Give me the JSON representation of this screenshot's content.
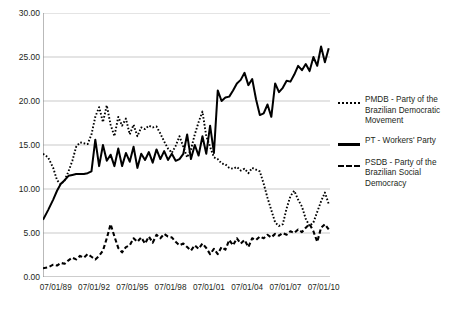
{
  "chart_data": {
    "type": "line",
    "title": "",
    "xlabel": "",
    "ylabel": "",
    "ylim": [
      0,
      30
    ],
    "yticks": [
      "0.00",
      "5.00",
      "10.00",
      "15.00",
      "20.00",
      "25.00",
      "30.00"
    ],
    "grid": true,
    "legend_position": "right",
    "xtick_labels": [
      "07/01/89",
      "07/01/92",
      "07/01/95",
      "07/01/98",
      "07/01/01",
      "07/01/04",
      "07/01/07",
      "07/01/10"
    ],
    "xlim_years": [
      1988.5,
      2011.0
    ],
    "series": [
      {
        "name": "PMDB - Party of the Brazilian Democratic Movement",
        "short": "PMDB",
        "style": "dotted",
        "color": "#000000",
        "x": [
          1988.5,
          1988.9,
          1989.3,
          1989.6,
          1989.9,
          1990.2,
          1990.5,
          1990.8,
          1991.1,
          1991.4,
          1991.7,
          1992.0,
          1992.3,
          1992.6,
          1992.9,
          1993.2,
          1993.5,
          1993.8,
          1994.1,
          1994.4,
          1994.7,
          1995.0,
          1995.3,
          1995.6,
          1995.9,
          1996.2,
          1996.5,
          1996.8,
          1997.1,
          1997.4,
          1997.7,
          1998.0,
          1998.3,
          1998.6,
          1998.9,
          1999.2,
          1999.5,
          1999.8,
          2000.1,
          2000.4,
          2000.7,
          2001.0,
          2001.3,
          2001.6,
          2001.9,
          2002.2,
          2002.5,
          2002.8,
          2003.1,
          2003.4,
          2003.7,
          2004.0,
          2004.3,
          2004.6,
          2004.9,
          2005.2,
          2005.5,
          2005.8,
          2006.1,
          2006.4,
          2006.7,
          2007.0,
          2007.3,
          2007.6,
          2007.9,
          2008.2,
          2008.5,
          2008.8,
          2009.1,
          2009.4,
          2009.7,
          2010.0,
          2010.3,
          2010.6,
          2010.9
        ],
        "values": [
          14.0,
          13.6,
          12.4,
          11.0,
          10.5,
          11.0,
          12.0,
          13.2,
          14.8,
          15.3,
          15.2,
          15.1,
          16.2,
          18.2,
          19.3,
          17.6,
          19.5,
          17.3,
          16.0,
          18.2,
          17.2,
          18.0,
          16.2,
          17.3,
          16.0,
          17.0,
          16.8,
          17.2,
          17.0,
          17.1,
          16.3,
          15.4,
          14.6,
          14.1,
          14.9,
          16.0,
          14.8,
          13.6,
          14.5,
          16.2,
          17.6,
          18.8,
          16.0,
          14.8,
          13.6,
          13.4,
          12.9,
          12.8,
          12.4,
          12.3,
          12.5,
          12.1,
          12.3,
          11.8,
          12.4,
          12.2,
          12.0,
          10.6,
          9.0,
          7.6,
          6.2,
          5.8,
          6.0,
          7.8,
          9.2,
          9.8,
          8.8,
          8.0,
          6.6,
          5.8,
          6.2,
          7.4,
          8.6,
          9.6,
          8.3
        ]
      },
      {
        "name": "PT - Workers' Party",
        "short": "PT",
        "style": "solid",
        "color": "#000000",
        "x": [
          1988.5,
          1988.9,
          1989.3,
          1989.6,
          1989.9,
          1990.2,
          1990.5,
          1990.8,
          1991.1,
          1991.4,
          1991.7,
          1992.0,
          1992.3,
          1992.6,
          1992.9,
          1993.2,
          1993.5,
          1993.8,
          1994.1,
          1994.4,
          1994.7,
          1995.0,
          1995.3,
          1995.6,
          1995.9,
          1996.2,
          1996.5,
          1996.8,
          1997.1,
          1997.4,
          1997.7,
          1998.0,
          1998.3,
          1998.6,
          1998.9,
          1999.2,
          1999.5,
          1999.8,
          2000.1,
          2000.4,
          2000.7,
          2001.0,
          2001.3,
          2001.6,
          2001.9,
          2002.2,
          2002.5,
          2002.8,
          2003.1,
          2003.4,
          2003.7,
          2004.0,
          2004.3,
          2004.6,
          2004.9,
          2005.2,
          2005.5,
          2005.8,
          2006.1,
          2006.4,
          2006.7,
          2007.0,
          2007.3,
          2007.6,
          2007.9,
          2008.2,
          2008.5,
          2008.8,
          2009.1,
          2009.4,
          2009.7,
          2010.0,
          2010.3,
          2010.6,
          2010.9
        ],
        "values": [
          6.5,
          7.6,
          8.8,
          9.8,
          10.6,
          11.0,
          11.5,
          11.6,
          11.7,
          11.7,
          11.7,
          11.8,
          12.0,
          15.6,
          12.6,
          15.0,
          13.2,
          13.9,
          12.6,
          14.6,
          12.6,
          14.1,
          13.1,
          14.8,
          12.4,
          14.0,
          13.3,
          14.2,
          13.0,
          14.5,
          13.4,
          14.3,
          13.3,
          14.0,
          13.2,
          13.4,
          14.0,
          16.2,
          13.4,
          15.0,
          13.8,
          16.0,
          14.0,
          17.2,
          14.1,
          21.2,
          20.0,
          20.4,
          20.5,
          21.2,
          22.0,
          22.4,
          23.2,
          21.8,
          22.5,
          20.2,
          18.4,
          18.6,
          19.6,
          18.2,
          22.0,
          21.0,
          21.5,
          22.3,
          22.2,
          23.0,
          24.0,
          23.5,
          24.2,
          23.4,
          25.0,
          24.0,
          26.2,
          24.4,
          26.0
        ]
      },
      {
        "name": "PSDB - Party of the Brazilian Social Democracy",
        "short": "PSDB",
        "style": "dashed",
        "color": "#000000",
        "x": [
          1988.5,
          1988.9,
          1989.3,
          1989.6,
          1989.9,
          1990.2,
          1990.5,
          1990.8,
          1991.1,
          1991.4,
          1991.7,
          1992.0,
          1992.3,
          1992.6,
          1992.9,
          1993.2,
          1993.5,
          1993.8,
          1994.1,
          1994.4,
          1994.7,
          1995.0,
          1995.3,
          1995.6,
          1995.9,
          1996.2,
          1996.5,
          1996.8,
          1997.1,
          1997.4,
          1997.7,
          1998.0,
          1998.3,
          1998.6,
          1998.9,
          1999.2,
          1999.5,
          1999.8,
          2000.1,
          2000.4,
          2000.7,
          2001.0,
          2001.3,
          2001.6,
          2001.9,
          2002.2,
          2002.5,
          2002.8,
          2003.1,
          2003.4,
          2003.7,
          2004.0,
          2004.3,
          2004.6,
          2004.9,
          2005.2,
          2005.5,
          2005.8,
          2006.1,
          2006.4,
          2006.7,
          2007.0,
          2007.3,
          2007.6,
          2007.9,
          2008.2,
          2008.5,
          2008.8,
          2009.1,
          2009.4,
          2009.7,
          2010.0,
          2010.3,
          2010.6,
          2010.9
        ],
        "values": [
          1.0,
          1.1,
          1.4,
          1.3,
          1.6,
          1.5,
          1.9,
          2.2,
          2.0,
          2.4,
          2.2,
          2.6,
          2.3,
          2.0,
          2.4,
          3.0,
          4.4,
          6.0,
          4.6,
          3.3,
          2.8,
          3.4,
          3.6,
          4.4,
          4.0,
          4.5,
          3.8,
          4.6,
          3.9,
          4.8,
          4.4,
          4.9,
          4.6,
          4.5,
          4.0,
          3.6,
          3.8,
          3.4,
          3.0,
          3.6,
          3.2,
          3.8,
          3.3,
          2.6,
          3.2,
          2.6,
          3.4,
          3.1,
          4.2,
          3.6,
          4.4,
          3.8,
          4.2,
          3.4,
          4.4,
          4.2,
          4.6,
          4.4,
          4.8,
          4.5,
          4.9,
          4.7,
          5.0,
          4.8,
          5.2,
          5.0,
          5.4,
          5.1,
          5.6,
          6.0,
          5.2,
          4.0,
          5.6,
          6.0,
          5.4
        ]
      }
    ]
  },
  "legend": {
    "items": [
      {
        "label": "PMDB - Party of the Brazilian Democratic Movement",
        "style": "dotted"
      },
      {
        "label": "PT - Workers' Party",
        "style": "solid"
      },
      {
        "label": "PSDB - Party of the Brazilian Social Democracy",
        "style": "dashed"
      }
    ]
  }
}
